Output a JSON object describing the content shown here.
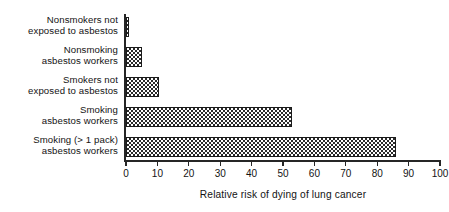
{
  "chart_data": {
    "type": "bar",
    "orientation": "horizontal",
    "title": "",
    "xlabel": "Relative risk of dying of lung cancer",
    "ylabel": "",
    "xlim": [
      0,
      100
    ],
    "xticks": [
      0,
      10,
      20,
      30,
      40,
      50,
      60,
      70,
      80,
      90,
      100
    ],
    "grid": false,
    "legend": null,
    "categories": [
      "Nonsmokers not\nexposed to asbestos",
      "Nonsmoking\nasbestos workers",
      "Smokers not\nexposed to asbestos",
      "Smoking\nasbestos workers",
      "Smoking (> 1 pack)\nasbestos workers"
    ],
    "values": [
      1,
      5,
      10.5,
      53,
      86
    ],
    "bar_fill": "checkerboard",
    "bar_color": "#2b2b2b",
    "axis_color": "#262626",
    "background": "#ffffff"
  },
  "axis": {
    "title": "Relative risk of dying of lung cancer",
    "tick_labels": [
      "0",
      "10",
      "20",
      "30",
      "40",
      "50",
      "60",
      "70",
      "80",
      "90",
      "100"
    ]
  },
  "categories": [
    {
      "label": "Nonsmokers not\nexposed to asbestos",
      "value": 1
    },
    {
      "label": "Nonsmoking\nasbestos workers",
      "value": 5
    },
    {
      "label": "Smokers not\nexposed to asbestos",
      "value": 10.5
    },
    {
      "label": "Smoking\nasbestos workers",
      "value": 53
    },
    {
      "label": "Smoking (> 1 pack)\nasbestos workers",
      "value": 86
    }
  ]
}
